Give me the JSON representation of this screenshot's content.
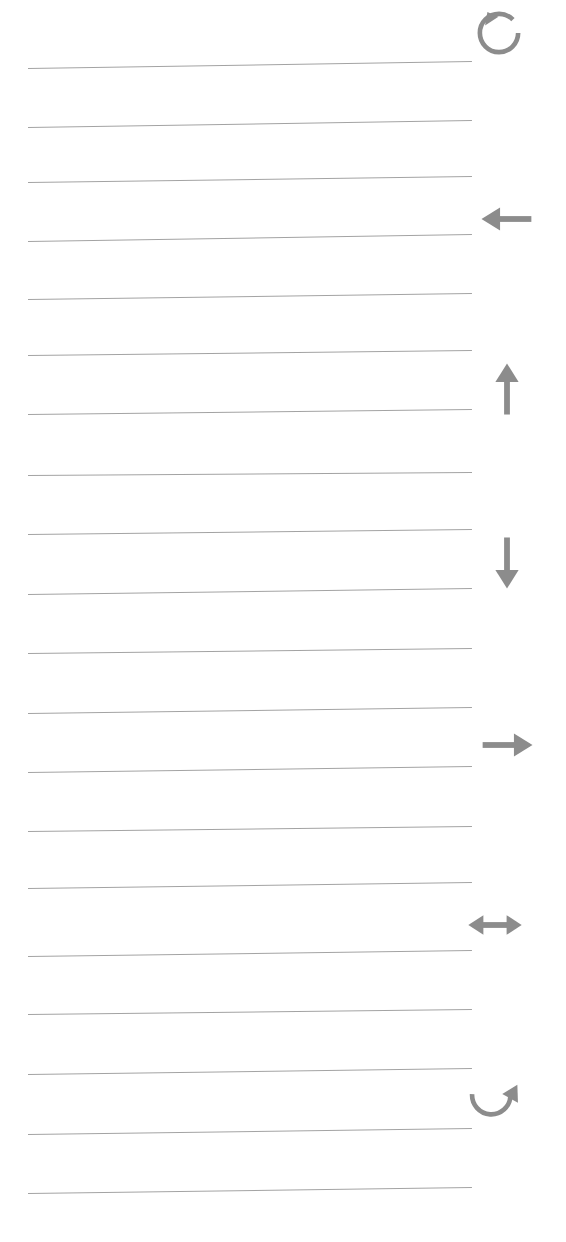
{
  "page": {
    "kind": "lined-paper-sheet",
    "width": 566,
    "height": 1242,
    "background_color": "#ffffff",
    "rule_color": "#a3a3a3",
    "icon_color": "#8c8c8c"
  },
  "rules": {
    "count": 20,
    "left_x": 28,
    "right_x": 472,
    "thickness_px": 1,
    "lines": [
      {
        "index": 1,
        "y_left": 68,
        "y_right": 61,
        "label": "rule-line-1"
      },
      {
        "index": 2,
        "y_left": 127,
        "y_right": 120,
        "label": "rule-line-2"
      },
      {
        "index": 3,
        "y_left": 182,
        "y_right": 176,
        "label": "rule-line-3"
      },
      {
        "index": 4,
        "y_left": 241,
        "y_right": 234,
        "label": "rule-line-4"
      },
      {
        "index": 5,
        "y_left": 299,
        "y_right": 293,
        "label": "rule-line-5"
      },
      {
        "index": 6,
        "y_left": 355,
        "y_right": 350,
        "label": "rule-line-6"
      },
      {
        "index": 7,
        "y_left": 414,
        "y_right": 409,
        "label": "rule-line-7"
      },
      {
        "index": 8,
        "y_left": 475,
        "y_right": 472,
        "label": "rule-line-8"
      },
      {
        "index": 9,
        "y_left": 534,
        "y_right": 529,
        "label": "rule-line-9"
      },
      {
        "index": 10,
        "y_left": 594,
        "y_right": 588,
        "label": "rule-line-10"
      },
      {
        "index": 11,
        "y_left": 653,
        "y_right": 648,
        "label": "rule-line-11"
      },
      {
        "index": 12,
        "y_left": 713,
        "y_right": 707,
        "label": "rule-line-12"
      },
      {
        "index": 13,
        "y_left": 772,
        "y_right": 766,
        "label": "rule-line-13"
      },
      {
        "index": 14,
        "y_left": 831,
        "y_right": 826,
        "label": "rule-line-14"
      },
      {
        "index": 15,
        "y_left": 888,
        "y_right": 882,
        "label": "rule-line-15"
      },
      {
        "index": 16,
        "y_left": 956,
        "y_right": 950,
        "label": "rule-line-16"
      },
      {
        "index": 17,
        "y_left": 1014,
        "y_right": 1009,
        "label": "rule-line-17"
      },
      {
        "index": 18,
        "y_left": 1074,
        "y_right": 1068,
        "label": "rule-line-18"
      },
      {
        "index": 19,
        "y_left": 1134,
        "y_right": 1128,
        "label": "rule-line-19"
      },
      {
        "index": 20,
        "y_left": 1193,
        "y_right": 1187,
        "label": "rule-line-20"
      }
    ]
  },
  "margin_icons": [
    {
      "name": "rotate-counterclockwise-icon",
      "glyph": "↺",
      "meaning": "rotate counter-clockwise",
      "x": 470,
      "y": 4,
      "size": 58,
      "color": "#8c8c8c"
    },
    {
      "name": "arrow-left-icon",
      "glyph": "←",
      "meaning": "move left",
      "x": 478,
      "y": 190,
      "size": 58,
      "color": "#8c8c8c"
    },
    {
      "name": "arrow-up-icon",
      "glyph": "↑",
      "meaning": "move up",
      "x": 478,
      "y": 360,
      "size": 58,
      "color": "#8c8c8c"
    },
    {
      "name": "arrow-down-icon",
      "glyph": "↓",
      "meaning": "move down",
      "x": 478,
      "y": 534,
      "size": 58,
      "color": "#8c8c8c"
    },
    {
      "name": "arrow-right-icon",
      "glyph": "→",
      "meaning": "move right",
      "x": 478,
      "y": 716,
      "size": 58,
      "color": "#8c8c8c"
    },
    {
      "name": "arrow-left-right-icon",
      "glyph": "↔",
      "meaning": "resize horizontally",
      "x": 466,
      "y": 896,
      "size": 58,
      "color": "#8c8c8c"
    },
    {
      "name": "rotate-clockwise-icon",
      "glyph": "↻",
      "meaning": "rotate clockwise",
      "x": 464,
      "y": 1072,
      "size": 58,
      "color": "#8c8c8c"
    }
  ]
}
